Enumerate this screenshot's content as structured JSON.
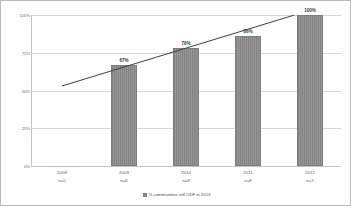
{
  "chart_data": {
    "type": "bar",
    "title": "",
    "xlabel": "",
    "ylabel": "",
    "ylim": [
      0,
      100
    ],
    "grid": true,
    "legend_position": "bottom",
    "legend": [
      {
        "label": "% communities still ODF in 2013",
        "marker": "square",
        "color": "#8e8e8e"
      }
    ],
    "categories": [
      "2008",
      "2009",
      "2010",
      "2011",
      "2012"
    ],
    "sample_sizes": [
      "n=0",
      "n=6",
      "n=9",
      "n=8",
      "n=7"
    ],
    "values": [
      0,
      67,
      78,
      86,
      100
    ],
    "data_labels": [
      "",
      "67%",
      "78%",
      "86%",
      "100%"
    ],
    "yticks": [
      0,
      25,
      50,
      75,
      100
    ],
    "ytick_labels": [
      "0%",
      "25%",
      "50%",
      "75%",
      "100%"
    ],
    "series": [
      {
        "name": "% communities still ODF in 2013",
        "values": [
          0,
          67,
          78,
          86,
          100
        ]
      }
    ],
    "trendline": {
      "type": "linear",
      "start": {
        "x": 0.5,
        "y": 53
      },
      "end": {
        "x": 4.25,
        "y": 100
      }
    },
    "colors": {
      "bar": "#8e8e8e",
      "bar_border": "#7d7d7d",
      "trendline": "#3f3f3f",
      "gridline": "#d6d6d6",
      "axis": "#c2c2c2",
      "tick_text": "#6d6d6d",
      "label_text": "#3a3a3a",
      "frame_border": "#b9b9b9"
    }
  }
}
